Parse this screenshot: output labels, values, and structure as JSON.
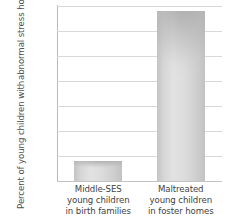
{
  "chart_data": {
    "type": "bar",
    "title": "",
    "xlabel": "",
    "ylabel": "Percent of young children with abnormal stress hormone levels",
    "ylabel_lines": [
      "Percent of young children with",
      "abnormal stress hormone levels"
    ],
    "categories": [
      "Middle-SES young children in birth families",
      "Maltreated young children in foster homes"
    ],
    "category_lines": [
      [
        "Middle-SES",
        "young children",
        "in birth families"
      ],
      [
        "Maltreated",
        "young children",
        "in foster homes"
      ]
    ],
    "values": [
      4,
      34
    ],
    "ylim": [
      0,
      35
    ],
    "yticks": [
      0,
      5,
      10,
      15,
      20,
      25,
      30,
      35
    ],
    "ytick_labels": [
      "0",
      "5",
      "10",
      "15",
      "20",
      "25",
      "30",
      "35"
    ],
    "grid": true,
    "legend": false,
    "colors": {
      "bar_fill": "#d8d8d8",
      "bar_edge": "#c2c2c2",
      "gridline": "#d8d8d8",
      "axis": "#b9b9b9",
      "text": "#4a4a4a",
      "background": "#ffffff"
    }
  }
}
